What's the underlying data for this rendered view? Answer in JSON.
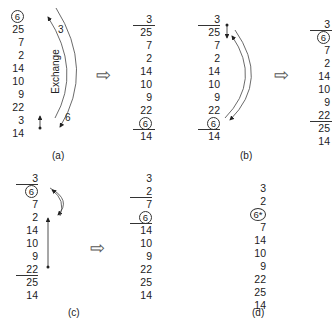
{
  "panels": [
    {
      "id": "a",
      "caption": "(a)",
      "before": [
        "6",
        "25",
        "7",
        "2",
        "14",
        "10",
        "9",
        "22",
        "3",
        "14"
      ],
      "circled_before": 0,
      "annotations": {
        "exchange_label": "Exchange",
        "top_value": "3",
        "bottom_value": "6"
      },
      "after": [
        "3",
        "25",
        "7",
        "2",
        "14",
        "10",
        "9",
        "22",
        "6",
        "14"
      ],
      "circled_after": 8
    },
    {
      "id": "b",
      "caption": "(b)",
      "before": [
        "3",
        "25",
        "7",
        "2",
        "14",
        "10",
        "9",
        "22",
        "6",
        "14"
      ],
      "circled_before": 8,
      "after": [
        "3",
        "6",
        "7",
        "2",
        "14",
        "10",
        "9",
        "22",
        "25",
        "14"
      ],
      "circled_after": 1
    },
    {
      "id": "c",
      "caption": "(c)",
      "before": [
        "3",
        "6",
        "7",
        "2",
        "14",
        "10",
        "9",
        "22",
        "25",
        "14"
      ],
      "circled_before": 1,
      "after": [
        "3",
        "2",
        "7",
        "6",
        "14",
        "10",
        "9",
        "22",
        "25",
        "14"
      ],
      "circled_after": 3
    },
    {
      "id": "d",
      "caption": "(d)",
      "final": [
        "3",
        "2",
        "6*",
        "7",
        "14",
        "10",
        "9",
        "22",
        "25",
        "14"
      ],
      "circled_final": 2
    }
  ],
  "arrow_symbol": "⇨"
}
